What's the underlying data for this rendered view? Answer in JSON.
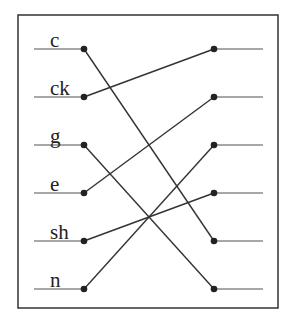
{
  "diagram": {
    "type": "matching-exercise",
    "frame": {
      "x": 18,
      "y": 15,
      "width": 260,
      "height": 293
    },
    "colors": {
      "frame": "#333333",
      "stub": "#8a8a8a",
      "connector": "#333333",
      "dot": "#222222",
      "text": "#222222"
    },
    "rows_y": [
      49,
      97,
      145,
      193,
      241,
      289
    ],
    "left_column": {
      "stub_x1": 34,
      "dot_x": 84,
      "label_x": 50,
      "items": [
        {
          "label": "c"
        },
        {
          "label": "ck"
        },
        {
          "label": "g"
        },
        {
          "label": "e"
        },
        {
          "label": "sh"
        },
        {
          "label": "n"
        }
      ]
    },
    "right_column": {
      "dot_x": 214,
      "stub_x2": 263,
      "items": [
        {
          "label": ""
        },
        {
          "label": ""
        },
        {
          "label": ""
        },
        {
          "label": ""
        },
        {
          "label": ""
        },
        {
          "label": ""
        }
      ]
    },
    "connections": [
      {
        "from": 0,
        "to": 4
      },
      {
        "from": 1,
        "to": 0
      },
      {
        "from": 2,
        "to": 5
      },
      {
        "from": 3,
        "to": 1
      },
      {
        "from": 4,
        "to": 3
      },
      {
        "from": 5,
        "to": 2
      }
    ]
  }
}
